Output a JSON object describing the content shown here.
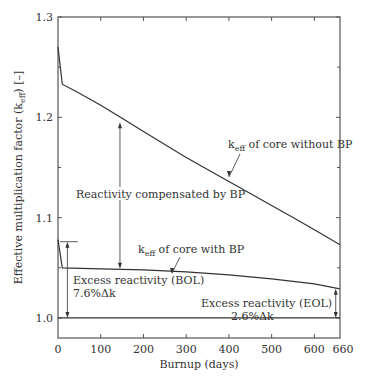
{
  "chart_data": {
    "type": "line",
    "title": "",
    "xlabel": "Burnup (days)",
    "ylabel": "Effective multiplication factor (k_eff) [–]",
    "ylabel_parts": {
      "pre": "Effective multiplication factor (k",
      "sub": "eff",
      "post": ") [–]"
    },
    "xlim": [
      0,
      660
    ],
    "ylim": [
      0.98,
      1.3
    ],
    "x_ticks": [
      0,
      100,
      200,
      300,
      400,
      500,
      600,
      660
    ],
    "x_tick_labels": [
      "0",
      "100",
      "200",
      "300",
      "400",
      "500",
      "600",
      "660"
    ],
    "y_ticks": [
      1.0,
      1.1,
      1.2,
      1.3
    ],
    "y_tick_labels": [
      "1.0",
      "1.1",
      "1.2",
      "1.3"
    ],
    "y_minor_ticks": [
      1.05,
      1.15,
      1.25
    ],
    "x_minor_ticks": [
      100,
      200,
      300,
      400,
      500,
      600
    ],
    "grid": false,
    "reference_line": {
      "y": 1.0
    },
    "series": [
      {
        "name": "k_eff of core without BP",
        "x": [
          0,
          10,
          50,
          100,
          150,
          200,
          250,
          300,
          350,
          400,
          450,
          500,
          550,
          600,
          660
        ],
        "values": [
          1.27,
          1.233,
          1.224,
          1.212,
          1.199,
          1.186,
          1.173,
          1.16,
          1.148,
          1.136,
          1.124,
          1.112,
          1.1,
          1.088,
          1.073
        ]
      },
      {
        "name": "k_eff of core with BP",
        "x": [
          0,
          10,
          100,
          200,
          300,
          400,
          500,
          600,
          660
        ],
        "values": [
          1.078,
          1.05,
          1.049,
          1.048,
          1.046,
          1.043,
          1.039,
          1.034,
          1.029
        ]
      }
    ],
    "annotations": [
      {
        "id": "without-bp",
        "pre": "k",
        "sub": "eff",
        "post": " of core without BP",
        "anchor": {
          "x": 270,
          "y": 1.165
        }
      },
      {
        "id": "with-bp",
        "pre": "k",
        "sub": "eff",
        "post": " of core with BP",
        "anchor": {
          "x": 270,
          "y": 1.05
        }
      },
      {
        "id": "compensated",
        "text": "Reactivity compensated by BP",
        "arrow_x": 145,
        "from_y": 1.195,
        "to_y": 1.049
      },
      {
        "id": "bol",
        "text": "Excess reactivity (BOL)",
        "value": "7.6%Δk",
        "arrow_x": 22,
        "from_y": 1.076,
        "to_y": 1.0
      },
      {
        "id": "eol",
        "text": "Excess reactivity (EOL)",
        "value": "2.6%Δk",
        "arrow_x": 650,
        "from_y": 1.029,
        "to_y": 1.0
      }
    ]
  }
}
